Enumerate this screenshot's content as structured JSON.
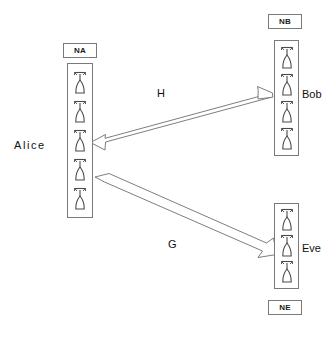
{
  "diagram": {
    "background_color": "#ffffff",
    "stroke_color": "#7a7a7a",
    "text_color": "#111111"
  },
  "nodes": [
    {
      "id": "alice",
      "label": "Alice",
      "tag": "NA",
      "tag_position": "above",
      "antenna_count": 5,
      "antenna_icon": "antenna-icon",
      "box": {
        "x": 67,
        "y": 63,
        "width": 26,
        "height": 155
      },
      "tag_box": {
        "x": 63,
        "y": 43,
        "width": 34,
        "height": 15
      },
      "label_position": {
        "x": 14,
        "y": 139
      }
    },
    {
      "id": "bob",
      "label": "Bob",
      "tag": "NB",
      "tag_position": "above",
      "antenna_count": 4,
      "antenna_icon": "antenna-icon",
      "box": {
        "x": 274,
        "y": 40,
        "width": 25,
        "height": 116
      },
      "tag_box": {
        "x": 268,
        "y": 14,
        "width": 34,
        "height": 15
      },
      "label_position": {
        "x": 302,
        "y": 88
      }
    },
    {
      "id": "eve",
      "label": "Eve",
      "tag": "NE",
      "tag_position": "below",
      "antenna_count": 3,
      "antenna_icon": "antenna-icon",
      "box": {
        "x": 274,
        "y": 203,
        "width": 25,
        "height": 86
      },
      "tag_box": {
        "x": 268,
        "y": 300,
        "width": 34,
        "height": 15
      },
      "label_position": {
        "x": 302,
        "y": 242
      }
    }
  ],
  "edges": [
    {
      "id": "h",
      "label": "H",
      "from": "alice",
      "to": "bob",
      "arrow_type": "double-headed",
      "label_position": {
        "x": 157,
        "y": 87
      }
    },
    {
      "id": "g",
      "label": "G",
      "from": "alice",
      "to": "eve",
      "arrow_type": "single-headed",
      "label_position": {
        "x": 168,
        "y": 238
      }
    }
  ]
}
